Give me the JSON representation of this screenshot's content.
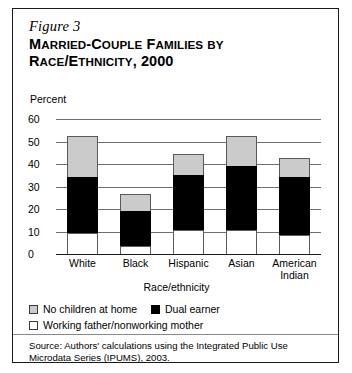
{
  "figure": {
    "number": "Figure 3",
    "title_line1": "Married-Couple Families by",
    "title_line2": "Race/Ethnicity, 2000",
    "percent_label": "Percent"
  },
  "chart_data": {
    "type": "bar",
    "stacked": true,
    "title": "Married-Couple Families by Race/Ethnicity, 2000",
    "xlabel": "Race/ethnicity",
    "ylabel": "Percent",
    "ylim": [
      0,
      60
    ],
    "yticks": [
      "60",
      "50",
      "40",
      "30",
      "20",
      "10",
      "0"
    ],
    "ytick_values": [
      60,
      50,
      40,
      30,
      20,
      10,
      0
    ],
    "grid": true,
    "legend_position": "below",
    "categories": [
      "White",
      "Black",
      "Hispanic",
      "Asian",
      "American Indian"
    ],
    "category_labels": [
      {
        "line1": "White",
        "line2": ""
      },
      {
        "line1": "Black",
        "line2": ""
      },
      {
        "line1": "Hispanic",
        "line2": ""
      },
      {
        "line1": "Asian",
        "line2": ""
      },
      {
        "line1": "American",
        "line2": "Indian"
      }
    ],
    "series": [
      {
        "name": "Working father/nonworking mother",
        "color": "#ffffff",
        "values": [
          10,
          4,
          11,
          11,
          9
        ]
      },
      {
        "name": "Dual earner",
        "color": "#000000",
        "values": [
          25,
          16,
          25,
          29,
          26
        ]
      },
      {
        "name": "No children at home",
        "color": "#cbcbcb",
        "values": [
          19,
          8,
          10,
          14,
          9
        ]
      }
    ],
    "totals": [
      54,
      28,
      46,
      54,
      44
    ]
  },
  "legend": {
    "items": [
      {
        "label": "No children at home",
        "swatch": "gray"
      },
      {
        "label": "Dual earner",
        "swatch": "black"
      },
      {
        "label": "Working father/nonworking mother",
        "swatch": "white"
      }
    ]
  },
  "source": {
    "text": "Source: Authors' calculations using the Integrated Public Use Microdata Series (IPUMS), 2003."
  }
}
